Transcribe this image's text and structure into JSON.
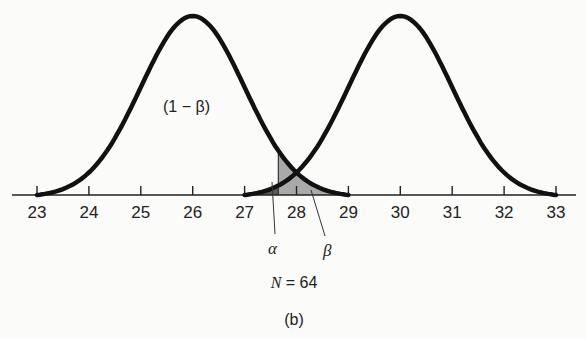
{
  "chart_data": {
    "type": "line",
    "title": "",
    "subtitle": "(b)",
    "xlabel": "",
    "ylabel": "",
    "xlim": [
      23,
      33
    ],
    "x_ticks": [
      23,
      24,
      25,
      26,
      27,
      28,
      29,
      30,
      31,
      32,
      33
    ],
    "grid": false,
    "legend": null,
    "series": [
      {
        "name": "H0 distribution",
        "type": "normal",
        "mean": 26,
        "range": [
          23,
          33
        ],
        "support": [
          23,
          29
        ]
      },
      {
        "name": "H1 distribution",
        "type": "normal",
        "mean": 30,
        "support": [
          27,
          33
        ]
      }
    ],
    "critical_value": 27.65,
    "shaded_regions": [
      {
        "label": "alpha",
        "symbol": "α",
        "from": 27.65,
        "to": 29,
        "under": "H0 curve",
        "shade": "#555555"
      },
      {
        "label": "beta",
        "symbol": "β",
        "from": 27,
        "to": 27.65,
        "under": "H1 curve",
        "shade": "#9a9a9a"
      }
    ],
    "annotations": [
      {
        "text": "(1 − β)",
        "x": 25.6,
        "position": "inside left curve"
      },
      {
        "text": "α",
        "points_to": 27.6
      },
      {
        "text": "β",
        "points_to": 28.2
      },
      {
        "text": "N = 64",
        "position": "below axis"
      },
      {
        "text": "(b)",
        "position": "caption"
      }
    ]
  },
  "labels": {
    "ticks": [
      "23",
      "24",
      "25",
      "26",
      "27",
      "28",
      "29",
      "30",
      "31",
      "32",
      "33"
    ],
    "power": "(1 − β)",
    "alpha": "α",
    "beta": "β",
    "n_label": "N = 64",
    "panel": "(b)"
  }
}
